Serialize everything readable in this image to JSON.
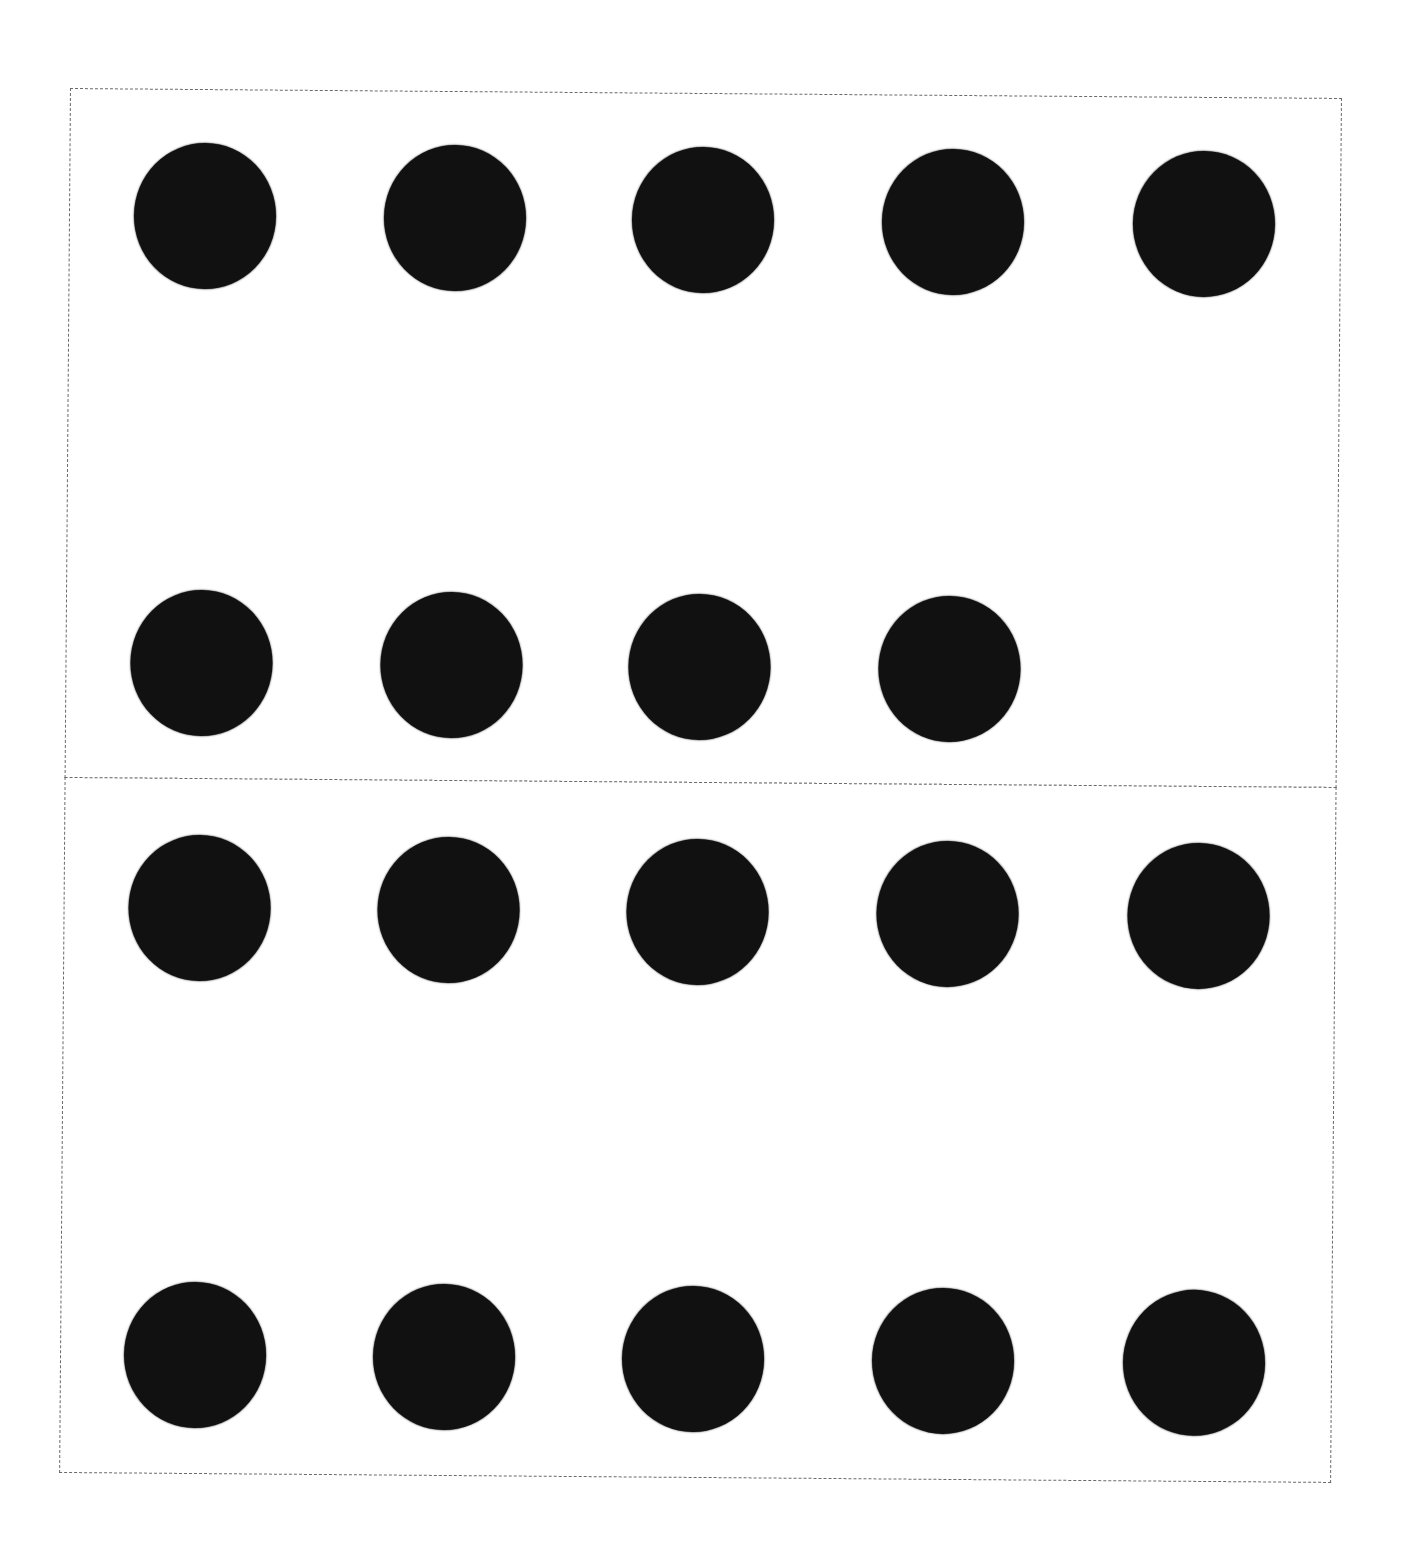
{
  "worksheet": {
    "dot_color": "#111111",
    "border_color": "#6a6a6a",
    "border_style": "dashed",
    "panels": [
      {
        "name": "top-panel",
        "total_dots": 9,
        "rows": [
          {
            "dots": [
              true,
              true,
              true,
              true,
              true
            ]
          },
          {
            "dots": [
              true,
              true,
              true,
              true,
              false
            ]
          }
        ]
      },
      {
        "name": "bottom-panel",
        "total_dots": 10,
        "rows": [
          {
            "dots": [
              true,
              true,
              true,
              true,
              true
            ]
          },
          {
            "dots": [
              true,
              true,
              true,
              true,
              true
            ]
          }
        ]
      }
    ]
  }
}
